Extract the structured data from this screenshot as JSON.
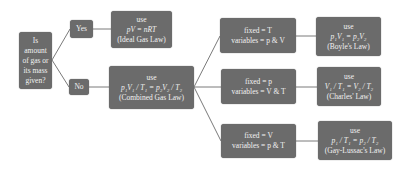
{
  "diagram": {
    "type": "flowchart",
    "colors": {
      "box_fill": "#6b6b6b",
      "box_text": "#f2f2f2",
      "connector": "#7a7a7a",
      "background": "#ffffff"
    },
    "question": {
      "lines": [
        "Is",
        "amount",
        "of gas or",
        "its mass",
        "given?"
      ]
    },
    "yes_label": "Yes",
    "no_label": "No",
    "ideal": {
      "use": "use",
      "equation": "pV = nRT",
      "name": "(Ideal Gas Law)"
    },
    "combined": {
      "use": "use",
      "equation": "p₁V₁ / T₁ = p₂V₂ / T₂",
      "name": "(Combined Gas Law)"
    },
    "branches": [
      {
        "fixed": "fixed = T",
        "variables": "variables = p & V",
        "law": {
          "use": "use",
          "equation": "p₁V₁ = p₂V₂",
          "name": "(Boyle's Law)"
        }
      },
      {
        "fixed": "fixed = p",
        "variables": "variables = V & T",
        "law": {
          "use": "use",
          "equation": "V₁ / T₁ = V₂ / T₂",
          "name": "(Charles' Law)"
        }
      },
      {
        "fixed": "fixed = V",
        "variables": "variables = p & T",
        "law": {
          "use": "use",
          "equation": "p₁ / T₁ = p₂ / T₂",
          "name": "(Gay-Lussac's Law)"
        }
      }
    ]
  }
}
